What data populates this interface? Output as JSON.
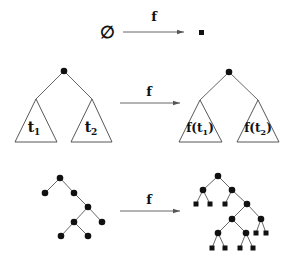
{
  "diagram": {
    "colors": {
      "ink": "#111111",
      "edge": "#555555",
      "background": "#ffffff"
    },
    "row_empty": {
      "left_symbol": "∅",
      "arrow_label": "f",
      "right_symbol": "leaf-square"
    },
    "row_recursive": {
      "arrow_label": "f",
      "left_subtree_labels": {
        "t1_base": "t",
        "t1_sub": "1",
        "t2_base": "t",
        "t2_sub": "2"
      },
      "right_subtree_labels": {
        "f1_pre": "f(t",
        "f1_sub": "1",
        "f1_post": ")",
        "f2_pre": "f(t",
        "f2_sub": "2",
        "f2_post": ")"
      }
    },
    "row_example": {
      "arrow_label": "f",
      "input_tree": {
        "nodes": [
          {
            "id": "a",
            "x": 60,
            "y": 178
          },
          {
            "id": "b",
            "x": 45,
            "y": 193
          },
          {
            "id": "c",
            "x": 74,
            "y": 193
          },
          {
            "id": "d",
            "x": 88,
            "y": 207
          },
          {
            "id": "e",
            "x": 74,
            "y": 222
          },
          {
            "id": "g",
            "x": 102,
            "y": 222
          },
          {
            "id": "h",
            "x": 61,
            "y": 236
          },
          {
            "id": "i",
            "x": 88,
            "y": 236
          }
        ],
        "edges": [
          [
            "a",
            "b"
          ],
          [
            "a",
            "c"
          ],
          [
            "c",
            "d"
          ],
          [
            "d",
            "e"
          ],
          [
            "d",
            "g"
          ],
          [
            "e",
            "h"
          ],
          [
            "e",
            "i"
          ]
        ]
      },
      "output_tree": {
        "internal_nodes": [
          {
            "id": "A",
            "x": 218,
            "y": 176
          },
          {
            "id": "B",
            "x": 203,
            "y": 190
          },
          {
            "id": "C",
            "x": 232,
            "y": 190
          },
          {
            "id": "D",
            "x": 247,
            "y": 204
          },
          {
            "id": "E",
            "x": 232,
            "y": 219
          },
          {
            "id": "G",
            "x": 261,
            "y": 219
          },
          {
            "id": "H",
            "x": 218,
            "y": 233
          },
          {
            "id": "I",
            "x": 246,
            "y": 233
          }
        ],
        "leaves": [
          {
            "id": "l1",
            "x": 196,
            "y": 204
          },
          {
            "id": "l2",
            "x": 210,
            "y": 204
          },
          {
            "id": "l3",
            "x": 225,
            "y": 204
          },
          {
            "id": "l4",
            "x": 256,
            "y": 233
          },
          {
            "id": "l5",
            "x": 266,
            "y": 233
          },
          {
            "id": "l6",
            "x": 212,
            "y": 248
          },
          {
            "id": "l7",
            "x": 225,
            "y": 248
          },
          {
            "id": "l8",
            "x": 240,
            "y": 248
          },
          {
            "id": "l9",
            "x": 253,
            "y": 248
          }
        ],
        "edges": [
          [
            "A",
            "B"
          ],
          [
            "A",
            "C"
          ],
          [
            "B",
            "l1"
          ],
          [
            "B",
            "l2"
          ],
          [
            "C",
            "l3"
          ],
          [
            "C",
            "D"
          ],
          [
            "D",
            "E"
          ],
          [
            "D",
            "G"
          ],
          [
            "G",
            "l4"
          ],
          [
            "G",
            "l5"
          ],
          [
            "E",
            "H"
          ],
          [
            "E",
            "I"
          ],
          [
            "H",
            "l6"
          ],
          [
            "H",
            "l7"
          ],
          [
            "I",
            "l8"
          ],
          [
            "I",
            "l9"
          ]
        ]
      }
    }
  }
}
